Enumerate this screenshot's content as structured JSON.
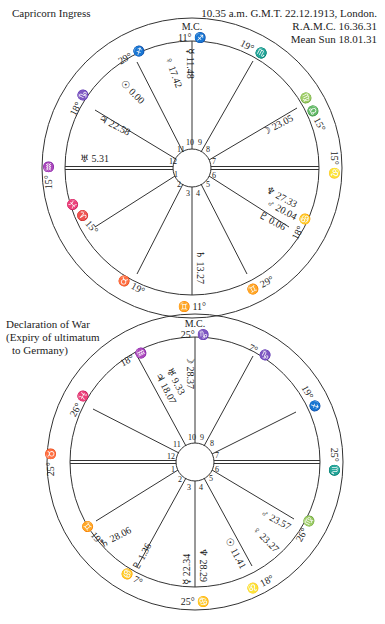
{
  "chart1": {
    "title": "Capricorn Ingress",
    "info_line1": "10.35 a.m. G.M.T. 22.12.1913, London.",
    "info_line2": "R.A.M.C. 16.36.31",
    "info_line3": "Mean Sun 18.01.31",
    "mc_label": "M.C.",
    "mc_value": "11° ♐",
    "ic_value": "♊ 11°",
    "cusps": {
      "c11": "29° ♐",
      "c12": "18° ♑",
      "asc": "15° ♒",
      "c2": "♓ ♈ 15°",
      "c3": "♉ 19°",
      "c5": "♊ 29°",
      "c6": "18° ♋",
      "desc": "15° ♌",
      "c8": "♍ ♎ 15°",
      "c9": "19° ♏"
    },
    "extra_signs": {
      "left_upper": "♒",
      "left_lower": "♓",
      "right_upper": "♎",
      "right_lower": "♍"
    },
    "planets": {
      "mercury": "☿ 11.48",
      "venus": "♀ 17.42",
      "sun": "☉ 0.00",
      "jupiter": "♃ 22.58",
      "uranus": "♅ 5.31",
      "moon": "☽ 23.05",
      "neptune": "♆ 27.33",
      "mars": "♂ 20.04",
      "pluto": "♇ 0.06",
      "saturn": "♄ 13.27"
    },
    "houses": [
      "1",
      "2",
      "3",
      "4",
      "5",
      "6",
      "7",
      "8",
      "9",
      "10",
      "11",
      "12"
    ]
  },
  "chart2": {
    "title_line1": "Declaration of War",
    "title_line2": "(Expiry of ultimatum",
    "title_line3": "to Germany)",
    "mc_label": "M.C.",
    "mc_value": "25° ♑",
    "ic_value": "25° ♋",
    "cusps": {
      "c11": "18° ♒",
      "c12": "26° ♓",
      "asc": "25° ♉",
      "c2": "♊ 19°",
      "c3": "♋ 7°",
      "c5": "♌ 18°",
      "c6": "26° ♍",
      "desc": "25° ♏",
      "c8": "19° ♐",
      "c9": "7° ♑"
    },
    "extra_signs": {
      "left_upper": "♈",
      "right_lower": "♎"
    },
    "planets": {
      "moon": "☽ 28.37",
      "uranus": "♅ 9.33",
      "jupiter": "♃ 18.07",
      "saturn": "♄ 28.06",
      "pluto": "♇ 1.36",
      "mercury": "☿ 22.34",
      "neptune": "♆ 28.29",
      "sun": "☉ 11.41",
      "mars": "♂ 23.57",
      "venus": "♀ 23.27"
    },
    "houses": [
      "1",
      "2",
      "3",
      "4",
      "5",
      "6",
      "7",
      "8",
      "9",
      "10",
      "11",
      "12"
    ]
  }
}
